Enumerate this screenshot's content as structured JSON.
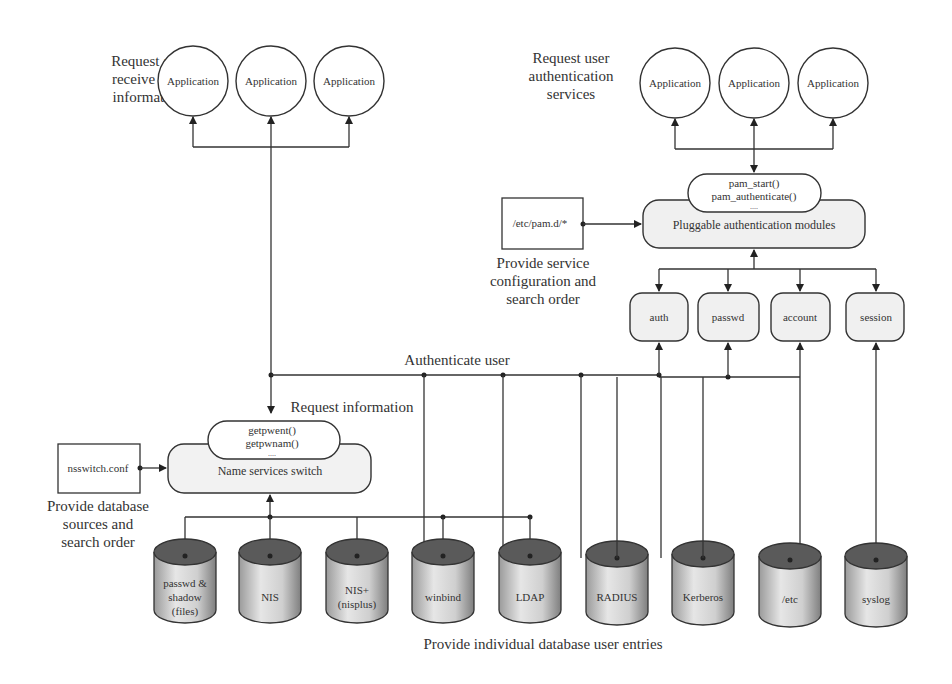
{
  "diagram": {
    "nss_side": {
      "caption": [
        "Request and",
        "receive user",
        "information"
      ],
      "applications": [
        "Application",
        "Application",
        "Application"
      ],
      "request_label": "Request information",
      "api_calls": [
        "getpwent()",
        "getpwnam()",
        "...."
      ],
      "switch_label": "Name services switch",
      "config_file": "nsswitch.conf",
      "config_caption": [
        "Provide database",
        "sources and",
        "search order"
      ]
    },
    "pam_side": {
      "caption": [
        "Request user",
        "authentication",
        "services"
      ],
      "applications": [
        "Application",
        "Application",
        "Application"
      ],
      "api_calls": [
        "pam_start()",
        "pam_authenticate()",
        "...."
      ],
      "modules_label": "Pluggable authentication modules",
      "config_file": "/etc/pam.d/*",
      "config_caption": [
        "Provide service",
        "configuration and",
        "search order"
      ],
      "module_types": [
        "auth",
        "passwd",
        "account",
        "session"
      ]
    },
    "authenticate_label": "Authenticate user",
    "databases": [
      {
        "label": [
          "passwd &",
          "shadow",
          "(files)"
        ]
      },
      {
        "label": [
          "NIS"
        ]
      },
      {
        "label": [
          "NIS+",
          "(nisplus)"
        ]
      },
      {
        "label": [
          "winbind"
        ]
      },
      {
        "label": [
          "LDAP"
        ]
      },
      {
        "label": [
          "RADIUS"
        ]
      },
      {
        "label": [
          "Kerberos"
        ]
      },
      {
        "label": [
          "/etc"
        ]
      },
      {
        "label": [
          "syslog"
        ]
      }
    ],
    "databases_caption": "Provide individual database user entries"
  }
}
